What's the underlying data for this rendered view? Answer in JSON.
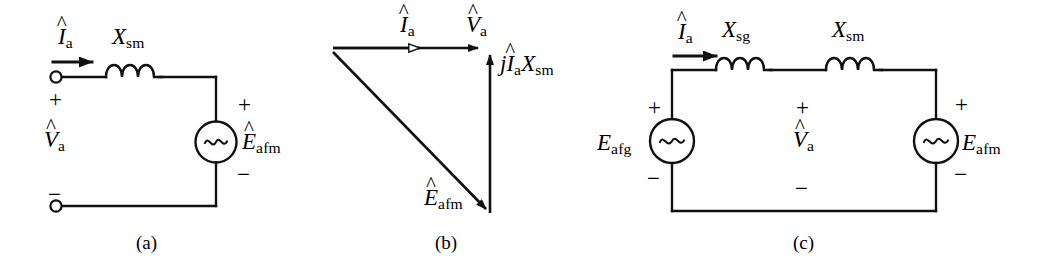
{
  "figure": {
    "type": "circuit-and-phasor-diagram",
    "stroke_color": "#111111",
    "background_color": "#ffffff",
    "panels": [
      {
        "id": "a",
        "caption": "(a)",
        "kind": "circuit",
        "labels": {
          "current": {
            "symbol": "I",
            "hat": true,
            "sub": "a"
          },
          "reactance": {
            "symbol": "X",
            "hat": false,
            "sub": "sm"
          },
          "terminal_voltage": {
            "symbol": "V",
            "hat": true,
            "sub": "a"
          },
          "source": {
            "symbol": "E",
            "hat": true,
            "sub": "afm"
          },
          "source_glyph": "~",
          "plus_top": "+",
          "minus_bottom": "−",
          "source_plus": "+",
          "source_minus": "−"
        }
      },
      {
        "id": "b",
        "caption": "(b)",
        "kind": "phasor",
        "labels": {
          "current_phasor": {
            "symbol": "I",
            "hat": true,
            "sub": "a"
          },
          "voltage_phasor": {
            "symbol": "V",
            "hat": true,
            "sub": "a"
          },
          "drop_phasor": {
            "prefix": "j",
            "symbol1": "I",
            "hat1": true,
            "sub1": "a",
            "symbol2": "X",
            "sub2": "sm"
          },
          "emf_phasor": {
            "symbol": "E",
            "hat": true,
            "sub": "afm"
          }
        }
      },
      {
        "id": "c",
        "caption": "(c)",
        "kind": "circuit",
        "labels": {
          "current": {
            "symbol": "I",
            "hat": true,
            "sub": "a"
          },
          "reactance_left": {
            "symbol": "X",
            "hat": false,
            "sub": "sg"
          },
          "reactance_right": {
            "symbol": "X",
            "hat": false,
            "sub": "sm"
          },
          "terminal_voltage": {
            "symbol": "V",
            "hat": true,
            "sub": "a"
          },
          "source_left": {
            "symbol": "E",
            "hat": false,
            "sub": "afg"
          },
          "source_right": {
            "symbol": "E",
            "hat": false,
            "sub": "afm"
          },
          "source_glyph": "~",
          "plus_mid": "+",
          "minus_mid": "−",
          "source_right_plus": "+",
          "source_right_minus": "−",
          "source_left_plus": "+",
          "source_left_minus": "−"
        }
      }
    ]
  }
}
